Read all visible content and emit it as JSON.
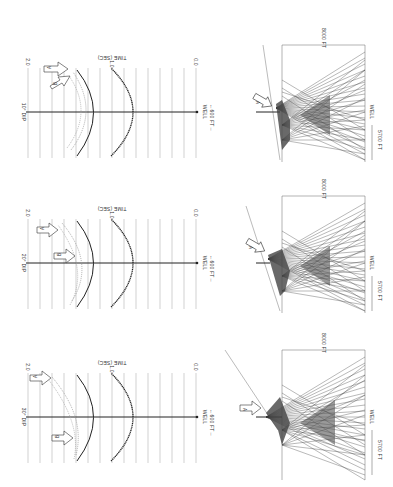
{
  "figure": {
    "orientation": "rotated-90-ccw",
    "panels": [
      {
        "id": "10deg",
        "dip_label": "10° DIP",
        "time_axis_title": "TIME (SEC)",
        "time_ticks": [
          "2.0",
          "1.0",
          "0.0"
        ],
        "well_label": "WELL",
        "scale_label": "←600 FT→",
        "arrow_labels": [
          "A",
          "B"
        ],
        "ray": {
          "depth_label": "8000 FT",
          "offset_label": "5700 FT",
          "well_label": "WELL",
          "arrow_label": "A"
        }
      },
      {
        "id": "20deg",
        "dip_label": "20° DIP",
        "time_axis_title": "TIME (SEC)",
        "time_ticks": [
          "2.0",
          "1.0",
          "0.0"
        ],
        "well_label": "WELL",
        "scale_label": "←600 FT→",
        "arrow_labels": [
          "A",
          "B"
        ],
        "ray": {
          "depth_label": "8000 FT",
          "offset_label": "5700 FT",
          "well_label": "WELL",
          "arrow_label": "A"
        }
      },
      {
        "id": "30deg",
        "dip_label": "30° DIP",
        "time_axis_title": "TIME (SEC)",
        "time_ticks": [
          "2.0",
          "1.0",
          "0.0"
        ],
        "well_label": "WELL",
        "scale_label": "←600 FT→",
        "arrow_labels": [
          "A",
          "B"
        ],
        "ray": {
          "depth_label": "8000 FT",
          "offset_label": "5700 FT",
          "well_label": "WELL",
          "arrow_label": "A"
        }
      }
    ]
  },
  "colors": {
    "ink": "#333333",
    "grid": "#9a9a9a",
    "ray": "#444444",
    "background": "#ffffff"
  }
}
